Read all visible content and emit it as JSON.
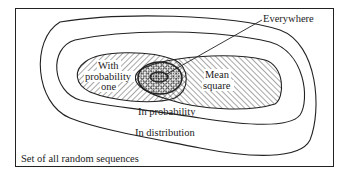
{
  "diagram": {
    "type": "nested-set venn diagram",
    "labels": {
      "everywhere": "Everywhere",
      "with_prob_1": "With",
      "with_prob_2": "probability",
      "with_prob_3": "one",
      "mean_1": "Mean",
      "mean_2": "square",
      "in_probability": "In probability",
      "in_distribution": "In distribution",
      "universe": "Set of all random sequences"
    },
    "colors": {
      "ink": "#222222",
      "background": "#ffffff"
    }
  }
}
